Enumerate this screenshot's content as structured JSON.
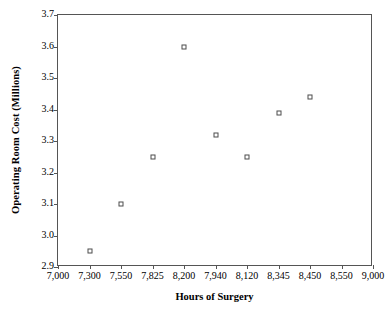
{
  "chart_data": {
    "type": "scatter",
    "title": "",
    "xlabel": "Hours of Surgery",
    "ylabel": "Operating Room Cost (Millions)",
    "grid": false,
    "legend": null,
    "ylim": [
      2.9,
      3.7
    ],
    "y_ticks": [
      "3.7",
      "3.6",
      "3.5",
      "3.4",
      "3.3",
      "3.2",
      "3.1",
      "3.0",
      "2.9"
    ],
    "y_tick_values": [
      3.7,
      3.6,
      3.5,
      3.4,
      3.3,
      3.2,
      3.1,
      3.0,
      2.9
    ],
    "x_tick_labels": [
      "7,000",
      "7,300",
      "7,550",
      "7,825",
      "8,200",
      "7,940",
      "8,120",
      "8,345",
      "8,450",
      "8,550",
      "9,000"
    ],
    "x_axis_note": "categorical-style evenly spaced ticks, labels not in ascending order",
    "marker_style": "open-square",
    "marker_color": "#4d4d4d",
    "points": [
      {
        "x": "7,300",
        "y": 2.95,
        "slot": 1
      },
      {
        "x": "7,550",
        "y": 3.1,
        "slot": 2
      },
      {
        "x": "7,825",
        "y": 3.25,
        "slot": 3
      },
      {
        "x": "8,200",
        "y": 3.6,
        "slot": 4
      },
      {
        "x": "7,940",
        "y": 3.32,
        "slot": 5
      },
      {
        "x": "8,120",
        "y": 3.25,
        "slot": 6
      },
      {
        "x": "8,345",
        "y": 3.39,
        "slot": 7
      },
      {
        "x": "8,450",
        "y": 3.44,
        "slot": 8
      }
    ]
  },
  "colors": {
    "axis": "#555555",
    "marker": "#4d4d4d",
    "text": "#000000",
    "background": "#ffffff"
  }
}
